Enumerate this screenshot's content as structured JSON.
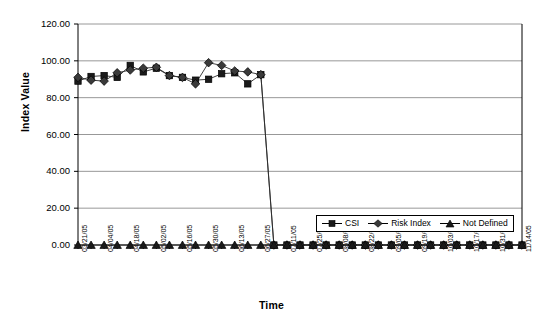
{
  "chart_data": {
    "type": "line",
    "title": "",
    "xlabel": "Time",
    "ylabel": "Index Value",
    "ylim": [
      0,
      120
    ],
    "yticks": [
      "0.00",
      "20.00",
      "40.00",
      "60.00",
      "80.00",
      "100.00",
      "120.00"
    ],
    "ytick_values": [
      0,
      20,
      40,
      60,
      80,
      100,
      120
    ],
    "grid": true,
    "legend_position": "inside-bottom-right",
    "x": [
      "03/21/05",
      "03/28/05",
      "04/04/05",
      "04/11/05",
      "04/18/05",
      "04/25/05",
      "05/02/05",
      "05/09/05",
      "05/16/05",
      "05/23/05",
      "05/30/05",
      "06/06/05",
      "06/13/05",
      "06/20/05",
      "06/27/05",
      "07/04/05",
      "07/11/05",
      "07/18/05",
      "07/25/05",
      "08/01/05",
      "08/08/05",
      "08/15/05",
      "08/22/05",
      "08/29/05",
      "09/05/05",
      "09/12/05",
      "09/19/05",
      "09/26/05",
      "10/03/05",
      "10/10/05",
      "10/17/05",
      "10/24/05",
      "10/31/05",
      "11/07/05",
      "11/14/05"
    ],
    "xtick_labels_shown": [
      "03/21/05",
      "04/04/05",
      "04/18/05",
      "05/02/05",
      "05/16/05",
      "05/30/05",
      "06/13/05",
      "06/27/05",
      "07/11/05",
      "07/25/05",
      "08/08/05",
      "08/22/05",
      "09/05/05",
      "09/19/05",
      "10/03/05",
      "10/17/05",
      "10/31/05",
      "11/14/05"
    ],
    "series": [
      {
        "name": "CSI",
        "marker": "square",
        "color": "#1a1a1a",
        "values": [
          89.0,
          91.5,
          92.0,
          91.0,
          97.5,
          94.0,
          96.0,
          92.0,
          91.0,
          89.5,
          90.0,
          93.0,
          93.5,
          87.5,
          92.5,
          0.0,
          0.0,
          0.0,
          0.0,
          0.0,
          0.0,
          0.0,
          0.0,
          0.0,
          0.0,
          0.0,
          0.0,
          0.0,
          0.0,
          0.0,
          0.0,
          0.0,
          0.0,
          0.0,
          0.0
        ]
      },
      {
        "name": "Risk Index",
        "marker": "diamond",
        "color": "#3a3a3a",
        "values": [
          91.0,
          89.5,
          89.0,
          93.5,
          95.0,
          96.0,
          96.5,
          92.0,
          91.0,
          87.5,
          99.0,
          97.5,
          94.5,
          94.0,
          92.5,
          0.0,
          0.0,
          0.0,
          0.0,
          0.0,
          0.0,
          0.0,
          0.0,
          0.0,
          0.0,
          0.0,
          0.0,
          0.0,
          0.0,
          0.0,
          0.0,
          0.0,
          0.0,
          0.0,
          0.0
        ]
      },
      {
        "name": "Not Defined",
        "marker": "triangle",
        "color": "#1a1a1a",
        "values": [
          0.0,
          0.0,
          0.0,
          0.0,
          0.0,
          0.0,
          0.0,
          0.0,
          0.0,
          0.0,
          0.0,
          0.0,
          0.0,
          0.0,
          0.0,
          0.0,
          0.0,
          0.0,
          0.0,
          0.0,
          0.0,
          0.0,
          0.0,
          0.0,
          0.0,
          0.0,
          0.0,
          0.0,
          0.0,
          0.0,
          0.0,
          0.0,
          0.0,
          0.0,
          0.0
        ]
      }
    ],
    "legend": [
      {
        "label": "CSI",
        "marker": "square"
      },
      {
        "label": "Risk Index",
        "marker": "diamond"
      },
      {
        "label": "Not Defined",
        "marker": "triangle"
      }
    ]
  }
}
